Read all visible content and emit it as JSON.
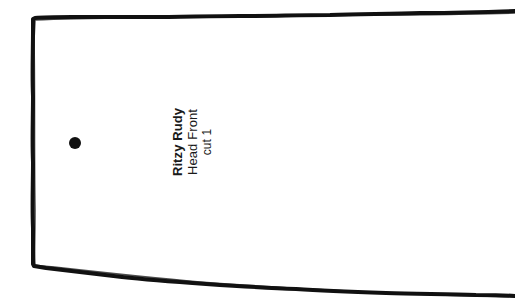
{
  "document": {
    "type": "sewing-pattern-piece",
    "background_color": "#ffffff",
    "ink_color": "#111111",
    "width": 515,
    "height": 305
  },
  "pattern": {
    "outline": {
      "name": "pattern-outline",
      "style": "hand-drawn",
      "stroke_color": "#111111",
      "stroke_width": 4,
      "fill": "none",
      "open_edge": "right"
    },
    "marker": {
      "name": "placement-dot",
      "shape": "filled-circle",
      "color": "#111111",
      "center_x": 75,
      "center_y": 143,
      "diameter": 12
    }
  },
  "label": {
    "orientation": "rotated-90-ccw",
    "align": "center",
    "lines": [
      {
        "text": "Ritzy Rudy",
        "weight": "bold"
      },
      {
        "text": "Head Front",
        "weight": "regular"
      },
      {
        "text": "cut 1",
        "weight": "regular"
      }
    ],
    "title": "Ritzy Rudy",
    "piece_name": "Head Front",
    "cut_instruction": "cut 1"
  }
}
